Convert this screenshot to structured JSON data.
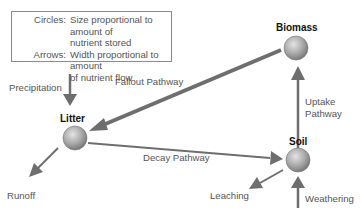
{
  "legend": {
    "rows": [
      {
        "key": "Circles:",
        "value": "Size proportional to amount of"
      },
      {
        "key": "",
        "value": "nutrient stored"
      },
      {
        "key": "Arrows:",
        "value": "Width proportional to amount"
      },
      {
        "key": "",
        "value": "of nutrient flow"
      }
    ]
  },
  "nodes": {
    "biomass": "Biomass",
    "litter": "Litter",
    "soil": "Soil"
  },
  "flows": {
    "precipitation": "Precipitation",
    "fallout": "Fallout Pathway",
    "uptake_line1": "Uptake",
    "uptake_line2": "Pathway",
    "decay": "Decay Pathway",
    "runoff": "Runoff",
    "leaching": "Leaching",
    "weathering": "Weathering"
  },
  "colors": {
    "arrow": "#6e6e6e",
    "node_fill": "#a8a8a8"
  }
}
